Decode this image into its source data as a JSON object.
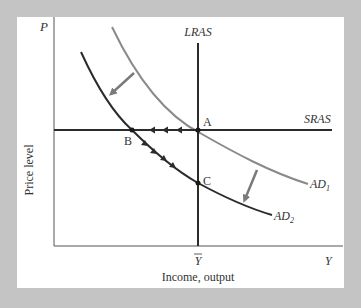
{
  "diagram": {
    "type": "AD-AS model",
    "axes": {
      "y_symbol": "P",
      "y_label": "Price level",
      "x_symbol": "Y",
      "x_label": "Income, output",
      "x_tick": "Y̅",
      "x_tick_base": "Y"
    },
    "curves": {
      "lras": "LRAS",
      "sras": "SRAS",
      "ad1": "AD",
      "ad1_sub": "1",
      "ad2": "AD",
      "ad2_sub": "2"
    },
    "points": {
      "a": "A",
      "b": "B",
      "c": "C"
    },
    "colors": {
      "background": "#c4c4c4",
      "panel": "#ffffff",
      "dark_line": "#2b2b2b",
      "gray_line": "#8a8a8a",
      "shift_arrow": "#7a7a7a"
    }
  }
}
